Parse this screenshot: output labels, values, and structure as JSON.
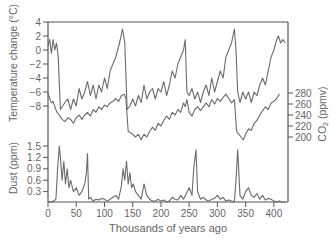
{
  "chart_data": {
    "type": "line",
    "title": "",
    "xlabel": "Thousands of years ago",
    "xlim": [
      0,
      425
    ],
    "x_ticks": [
      0,
      50,
      100,
      150,
      200,
      250,
      300,
      350,
      400
    ],
    "grid": false,
    "legend": "none",
    "axes": [
      {
        "name": "temperature",
        "label": "Temperature change (°C)",
        "side": "left",
        "ticks": [
          4,
          2,
          0,
          -2,
          -4,
          -6,
          -8
        ],
        "ylim": [
          -10,
          4
        ]
      },
      {
        "name": "co2",
        "label": "CO₂ (ppmv)",
        "side": "right",
        "ticks": [
          280,
          260,
          240,
          220,
          200
        ],
        "ylim": [
          180,
          280
        ]
      },
      {
        "name": "dust",
        "label": "Dust (ppm)",
        "side": "left",
        "ticks": [
          1.5,
          1.2,
          0.9,
          0.6,
          0.3
        ],
        "ylim": [
          0,
          1.5
        ]
      }
    ],
    "series": [
      {
        "name": "Temperature change",
        "axis": "temperature",
        "x": [
          0,
          3,
          6,
          9,
          12,
          15,
          18,
          22,
          26,
          30,
          35,
          40,
          45,
          50,
          55,
          60,
          65,
          70,
          75,
          80,
          85,
          90,
          95,
          100,
          105,
          110,
          115,
          120,
          125,
          128,
          132,
          136,
          140,
          145,
          150,
          155,
          160,
          165,
          170,
          175,
          180,
          185,
          190,
          195,
          200,
          205,
          210,
          215,
          220,
          225,
          230,
          235,
          240,
          243,
          246,
          250,
          255,
          260,
          265,
          270,
          275,
          280,
          285,
          290,
          295,
          300,
          305,
          310,
          315,
          320,
          325,
          330,
          333,
          336,
          340,
          345,
          350,
          355,
          360,
          365,
          370,
          375,
          380,
          385,
          390,
          395,
          400,
          405,
          408,
          412,
          416,
          420
        ],
        "values": [
          0.5,
          1.5,
          -0.5,
          1.5,
          0,
          1,
          -1,
          -8.5,
          -8,
          -7.5,
          -7,
          -8.5,
          -7,
          -8,
          -5.5,
          -7,
          -6,
          -4.5,
          -6.5,
          -5,
          -7,
          -5,
          -6,
          -4,
          -5.5,
          -3,
          -2,
          -1,
          0.5,
          1.5,
          3,
          1,
          -8.5,
          -8,
          -7,
          -8,
          -6.5,
          -7.5,
          -5,
          -7,
          -6,
          -5.5,
          -7,
          -5.5,
          -6,
          -4.5,
          -6.5,
          -5,
          -3,
          -4,
          -2,
          -1,
          0,
          1.5,
          -6,
          -6.5,
          -5.5,
          -7,
          -6,
          -7.5,
          -6,
          -5,
          -6.5,
          -4,
          -6,
          -4.5,
          -3,
          -4,
          -1,
          0,
          1,
          3,
          0,
          -6,
          -7.5,
          -6,
          -7,
          -6,
          -7.5,
          -6,
          -6.5,
          -5,
          -4,
          -5,
          -3,
          -1,
          0,
          1.5,
          2,
          1,
          1.5,
          1
        ]
      },
      {
        "name": "CO₂",
        "axis": "co2",
        "x": [
          0,
          3,
          6,
          9,
          12,
          16,
          20,
          25,
          30,
          35,
          40,
          45,
          50,
          55,
          60,
          65,
          70,
          75,
          80,
          85,
          90,
          95,
          100,
          105,
          110,
          115,
          120,
          125,
          130,
          135,
          138,
          142,
          146,
          150,
          155,
          160,
          165,
          170,
          175,
          180,
          185,
          190,
          195,
          200,
          205,
          210,
          215,
          220,
          225,
          230,
          235,
          240,
          243,
          246,
          250,
          255,
          260,
          265,
          270,
          275,
          280,
          285,
          290,
          295,
          300,
          305,
          310,
          315,
          320,
          325,
          330,
          334,
          338,
          342,
          346,
          350,
          355,
          360,
          365,
          370,
          375,
          380,
          385,
          390,
          395,
          400,
          405,
          410
        ],
        "values": [
          280,
          270,
          262,
          265,
          255,
          245,
          240,
          232,
          228,
          235,
          232,
          225,
          235,
          240,
          232,
          240,
          245,
          238,
          250,
          245,
          255,
          250,
          258,
          255,
          262,
          265,
          270,
          265,
          275,
          278,
          270,
          210,
          208,
          205,
          200,
          205,
          195,
          205,
          200,
          210,
          218,
          212,
          225,
          220,
          230,
          238,
          232,
          245,
          240,
          250,
          245,
          262,
          255,
          268,
          245,
          238,
          250,
          255,
          248,
          255,
          262,
          255,
          268,
          260,
          270,
          265,
          272,
          278,
          270,
          262,
          268,
          210,
          205,
          200,
          195,
          205,
          215,
          212,
          225,
          230,
          240,
          248,
          255,
          250,
          262,
          265,
          270,
          278
        ]
      },
      {
        "name": "Dust",
        "axis": "dust",
        "x": [
          0,
          5,
          10,
          14,
          17,
          20,
          22,
          25,
          28,
          31,
          34,
          37,
          40,
          45,
          50,
          55,
          60,
          65,
          68,
          70,
          72,
          75,
          80,
          85,
          90,
          95,
          100,
          105,
          110,
          115,
          120,
          125,
          130,
          133,
          136,
          139,
          142,
          145,
          148,
          151,
          155,
          160,
          165,
          170,
          175,
          180,
          185,
          190,
          195,
          200,
          205,
          210,
          215,
          220,
          225,
          230,
          235,
          240,
          245,
          250,
          255,
          258,
          262,
          265,
          270,
          275,
          280,
          285,
          290,
          295,
          300,
          305,
          310,
          315,
          320,
          325,
          330,
          333,
          336,
          340,
          345,
          350,
          355,
          360,
          365,
          370,
          375,
          380,
          385,
          390,
          395,
          400,
          405,
          410,
          415,
          420
        ],
        "values": [
          0.02,
          0.03,
          0.05,
          0.1,
          0.9,
          1.5,
          1.2,
          0.6,
          1.1,
          0.5,
          0.9,
          0.4,
          0.6,
          0.3,
          0.4,
          0.2,
          0.3,
          0.5,
          0.8,
          1.3,
          0.1,
          0.15,
          0.05,
          0.1,
          0.08,
          0.12,
          0.1,
          0.05,
          0.1,
          0.15,
          0.2,
          0.1,
          0.45,
          0.9,
          0.6,
          1.1,
          0.5,
          0.8,
          0.4,
          0.5,
          0.3,
          0.2,
          0.1,
          0.5,
          0.2,
          0.1,
          0.05,
          0.05,
          0.1,
          0.05,
          0.08,
          0.03,
          0.05,
          0.15,
          0.1,
          0.08,
          0.2,
          0.1,
          0.25,
          0.4,
          0.2,
          0.9,
          1.4,
          0.3,
          0.1,
          0.15,
          0.08,
          0.05,
          0.1,
          0.12,
          0.2,
          0.1,
          0.15,
          0.05,
          0.08,
          0.05,
          0.03,
          0.6,
          1.4,
          0.2,
          0.1,
          0.3,
          0.4,
          0.2,
          0.15,
          0.25,
          0.1,
          0.2,
          0.08,
          0.12,
          0.1,
          0.05,
          0.03,
          0.05,
          0.02,
          0.03
        ]
      }
    ]
  },
  "labels": {
    "xlabel": "Thousands of years ago",
    "temp_label": "Temperature change (°C)",
    "co2_label_main": "CO",
    "co2_label_sub": "2",
    "co2_label_unit": " (ppmv)",
    "dust_label": "Dust (ppm)"
  },
  "colors": {
    "line": "#6b6b6b",
    "axis": "#555555",
    "text": "#666666"
  }
}
